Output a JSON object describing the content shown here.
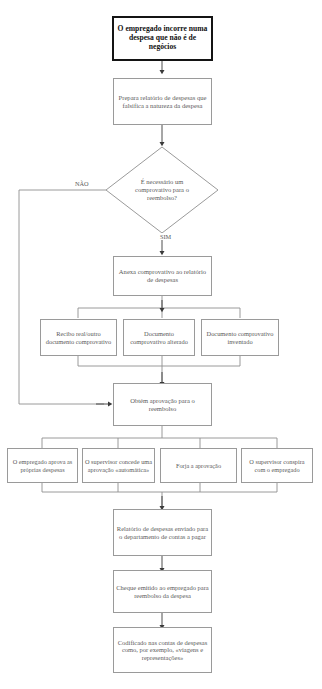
{
  "diagram": {
    "language": "pt-PT",
    "type": "flowchart",
    "line_color": "#8f8f8f",
    "text_color": "#5a5a5a",
    "start_border_color": "#141414",
    "background": "#ffffff"
  },
  "nodes": {
    "start": "O empregado incorre numa despesa que não é de negócios",
    "prepara": "Prepara relatório de despesas que falsifica a natureza da despesa",
    "decision": "É necessário um comprovativo para o reembolso?",
    "anexa": "Anexa comprovativo ao relatório de despesas",
    "recibo_real": "Recibo real/outro documento comprovativo",
    "doc_alterado": "Documento comprovativo alterado",
    "doc_inventado": "Documento comprovativo inventado",
    "obtem": "Obtém aprovação para o reembolso",
    "aprova_proprias": "O empregado aprova as próprias despesas",
    "aprovacao_automatica": "O supervisor concede uma aprovação «automática»",
    "forja": "Forja a aprovação",
    "conspira": "O supervisor conspira com o empregado",
    "enviado": "Relatório de despesas enviado para o departamento de contas a pagar",
    "cheque": "Cheque emitido ao empregado para reembolso da despesa",
    "codificado": "Codificado nas contas de despesas como, por exemplo, «viagens e representações»"
  },
  "edge_labels": {
    "nao": "NÃO",
    "sim": "SIM"
  }
}
